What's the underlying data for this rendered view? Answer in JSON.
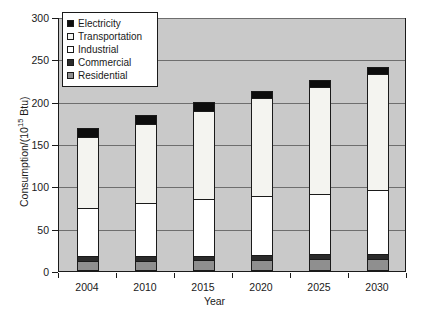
{
  "chart_data": {
    "type": "bar",
    "subtype": "stacked-vertical",
    "title": "",
    "xlabel": "Year",
    "ylabel": "Consumption/(10¹⁵ Btu)",
    "ylabel_parts": {
      "prefix": "Consumption/(10",
      "exponent": "15",
      "suffix": " Btu)"
    },
    "categories": [
      "2004",
      "2010",
      "2015",
      "2020",
      "2025",
      "2030"
    ],
    "ylim": [
      0,
      300
    ],
    "yticks": [
      0,
      50,
      100,
      150,
      200,
      250,
      300
    ],
    "ytick_labels": [
      "0",
      "50",
      "100",
      "150",
      "200",
      "250",
      "300"
    ],
    "grid": true,
    "grid_axis": "y",
    "legend_position": "upper-left-inside",
    "plot_background": "#c9c9c9",
    "series": [
      {
        "name": "Residential",
        "color": "#8f8f8f",
        "values": [
          11,
          11,
          12,
          12,
          13,
          13
        ]
      },
      {
        "name": "Commercial",
        "color": "#2b2b2b",
        "values": [
          5,
          5,
          5,
          6,
          6,
          6
        ]
      },
      {
        "name": "Industrial",
        "color": "#ffffff",
        "values": [
          57,
          63,
          67,
          69,
          71,
          76
        ]
      },
      {
        "name": "Transportation",
        "color": "#f4f4f0",
        "values": [
          84,
          93,
          104,
          116,
          126,
          137
        ]
      },
      {
        "name": "Electricity",
        "color": "#0d0d0d",
        "values": [
          11,
          11,
          10,
          9,
          8,
          8
        ]
      }
    ],
    "totals": [
      168,
      183,
      198,
      212,
      224,
      240
    ],
    "stack_order_bottom_to_top": [
      "Residential",
      "Commercial",
      "Industrial",
      "Transportation",
      "Electricity"
    ]
  },
  "legend": {
    "items": [
      {
        "label": "Electricity",
        "color": "#0d0d0d"
      },
      {
        "label": "Transportation",
        "color": "#f4f4f0"
      },
      {
        "label": "Industrial",
        "color": "#ffffff"
      },
      {
        "label": "Commercial",
        "color": "#2b2b2b"
      },
      {
        "label": "Residential",
        "color": "#8f8f8f"
      }
    ]
  }
}
